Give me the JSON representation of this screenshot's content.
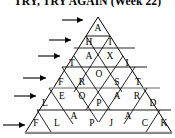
{
  "title": "TRY, TRY AGAIN (Week 22)",
  "puzzle": {
    "type": "triangle-word-pyramid",
    "rows": [
      {
        "index": 1,
        "answer": "A",
        "letters": [
          "A"
        ]
      },
      {
        "index": 2,
        "answer": "HI",
        "letters": [
          "H",
          "I"
        ]
      },
      {
        "index": 3,
        "answer": "TAXI",
        "letters": [
          "T",
          "A",
          "X",
          "I"
        ]
      },
      {
        "index": 4,
        "answer": "FROST",
        "letters": [
          "F",
          "R",
          "O",
          "S",
          "T"
        ]
      },
      {
        "index": 5,
        "answer": "LEOPARD",
        "letters": [
          "L",
          "E",
          "O",
          "P",
          "A",
          "R",
          "D"
        ]
      },
      {
        "index": 6,
        "answer": "FLAPJACK",
        "letters": [
          "F",
          "L",
          "A",
          "P",
          "J",
          "A",
          "C",
          "K"
        ]
      }
    ]
  },
  "cells": [
    {
      "id": "r1c1",
      "row": 1,
      "letter": "A",
      "x": 98,
      "y": 28
    },
    {
      "id": "r2c1",
      "row": 2,
      "letter": "H",
      "x": 89,
      "y": 42
    },
    {
      "id": "r2c2",
      "row": 2,
      "letter": "I",
      "x": 110,
      "y": 42
    },
    {
      "id": "r3c1",
      "row": 3,
      "letter": "T",
      "x": 72,
      "y": 63
    },
    {
      "id": "r3c2",
      "row": 3,
      "letter": "A",
      "x": 89,
      "y": 56
    },
    {
      "id": "r3c3",
      "row": 3,
      "letter": "X",
      "x": 110,
      "y": 56
    },
    {
      "id": "r3c4",
      "row": 3,
      "letter": "I",
      "x": 127,
      "y": 63
    },
    {
      "id": "r4c1",
      "row": 4,
      "letter": "F",
      "x": 61,
      "y": 82
    },
    {
      "id": "r4c2",
      "row": 4,
      "letter": "R",
      "x": 82,
      "y": 82
    },
    {
      "id": "r4c3",
      "row": 4,
      "letter": "O",
      "x": 99,
      "y": 74
    },
    {
      "id": "r4c4",
      "row": 4,
      "letter": "S",
      "x": 117,
      "y": 82
    },
    {
      "id": "r4c5",
      "row": 4,
      "letter": "T",
      "x": 138,
      "y": 82
    },
    {
      "id": "r5c1",
      "row": 5,
      "letter": "L",
      "x": 45,
      "y": 103
    },
    {
      "id": "r5c2",
      "row": 5,
      "letter": "E",
      "x": 62,
      "y": 96
    },
    {
      "id": "r5c3",
      "row": 5,
      "letter": "O",
      "x": 82,
      "y": 96
    },
    {
      "id": "r5c4",
      "row": 5,
      "letter": "P",
      "x": 99,
      "y": 103
    },
    {
      "id": "r5c5",
      "row": 5,
      "letter": "A",
      "x": 117,
      "y": 96
    },
    {
      "id": "r5c6",
      "row": 5,
      "letter": "R",
      "x": 137,
      "y": 96
    },
    {
      "id": "r5c7",
      "row": 5,
      "letter": "D",
      "x": 153,
      "y": 103
    },
    {
      "id": "r6c1",
      "row": 6,
      "letter": "F",
      "x": 36,
      "y": 123
    },
    {
      "id": "r6c2",
      "row": 6,
      "letter": "L",
      "x": 57,
      "y": 123
    },
    {
      "id": "r6c3",
      "row": 6,
      "letter": "A",
      "x": 74,
      "y": 116
    },
    {
      "id": "r6c4",
      "row": 6,
      "letter": "P",
      "x": 92,
      "y": 123
    },
    {
      "id": "r6c5",
      "row": 6,
      "letter": "J",
      "x": 111,
      "y": 123
    },
    {
      "id": "r6c6",
      "row": 6,
      "letter": "A",
      "x": 128,
      "y": 116
    },
    {
      "id": "r6c7",
      "row": 6,
      "letter": "C",
      "x": 145,
      "y": 123
    },
    {
      "id": "r6c8",
      "row": 6,
      "letter": "K",
      "x": 164,
      "y": 123
    }
  ],
  "arrows": [
    {
      "id": "arrow-row-1",
      "row": 1,
      "x1": 62,
      "y1": 20,
      "x2": 85,
      "y2": 20
    },
    {
      "id": "arrow-row-2",
      "row": 2,
      "x1": 49,
      "y1": 40,
      "x2": 73,
      "y2": 40
    },
    {
      "id": "arrow-row-3",
      "row": 3,
      "x1": 38,
      "y1": 56,
      "x2": 62,
      "y2": 56
    },
    {
      "id": "arrow-row-4",
      "row": 4,
      "x1": 23,
      "y1": 78,
      "x2": 48,
      "y2": 78
    },
    {
      "id": "arrow-row-5",
      "row": 5,
      "x1": 14,
      "y1": 96,
      "x2": 38,
      "y2": 96
    },
    {
      "id": "arrow-row-6",
      "row": 6,
      "x1": 3,
      "y1": 125,
      "x2": 27,
      "y2": 125
    }
  ],
  "colors": {
    "ink": "#000000",
    "line": "#000000",
    "highlight_rule": "#9a9a9a",
    "background": "#ffffff"
  },
  "geometry": {
    "apex_x": 98,
    "apex_y": 17,
    "base_left_x": 25,
    "base_right_x": 172,
    "base_y": 133,
    "row_count": 6
  }
}
